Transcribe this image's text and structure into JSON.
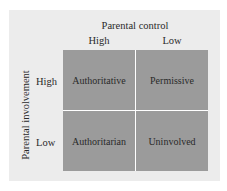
{
  "diagram": {
    "title": "Parental control",
    "y_axis_label": "Parental involvement",
    "columns": [
      "High",
      "Low"
    ],
    "rows": [
      "High",
      "Low"
    ],
    "cells": [
      [
        "Authoritative",
        "Permissive"
      ],
      [
        "Authoritarian",
        "Uninvolved"
      ]
    ],
    "colors": {
      "background_panel": "#ececec",
      "cell_fill": "#9b9b9b",
      "divider": "#ffffff"
    }
  }
}
